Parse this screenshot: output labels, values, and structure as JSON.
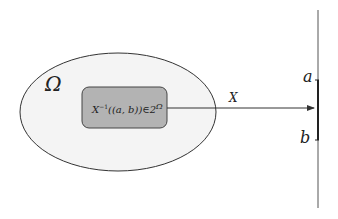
{
  "diagram": {
    "sample_space_label": "Ω",
    "preimage_label_prefix": "X",
    "preimage_label_sup": "−1",
    "preimage_label_body": "((a, b))∈2",
    "preimage_label_power": "Ω",
    "mapping_label": "X",
    "interval_start_label": "a",
    "interval_end_label": "b",
    "colors": {
      "ellipse_fill": "#f4f4f4",
      "ellipse_stroke": "#333333",
      "box_fill": "#b3b3b3",
      "box_stroke": "#444444",
      "line": "#333333"
    }
  }
}
